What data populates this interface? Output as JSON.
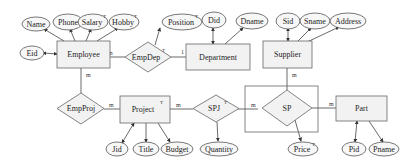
{
  "diagram": {
    "type": "entity-relationship",
    "entities": [
      {
        "id": "employee",
        "label": "Employee",
        "superscript": ""
      },
      {
        "id": "department",
        "label": "Department",
        "superscript": ""
      },
      {
        "id": "supplier",
        "label": "Supplier",
        "superscript": ""
      },
      {
        "id": "project",
        "label": "Project",
        "superscript": "T"
      },
      {
        "id": "part",
        "label": "Part",
        "superscript": ""
      }
    ],
    "relationships": [
      {
        "id": "empdep",
        "label": "EmpDep",
        "superscript": "T"
      },
      {
        "id": "empproj",
        "label": "EmpProj",
        "superscript": ""
      },
      {
        "id": "spj",
        "label": "SPJ",
        "superscript": "T"
      },
      {
        "id": "sp",
        "label": "SP",
        "superscript": "",
        "aggregated": true
      }
    ],
    "attributes": [
      {
        "id": "name",
        "label": "Name",
        "owner": "employee",
        "superscript": ""
      },
      {
        "id": "phone",
        "label": "Phone",
        "owner": "employee",
        "superscript": ""
      },
      {
        "id": "salary",
        "label": "Salary",
        "owner": "employee",
        "superscript": "T"
      },
      {
        "id": "hobby",
        "label": "Hobby",
        "owner": "employee",
        "superscript": "T"
      },
      {
        "id": "eid",
        "label": "Eid",
        "owner": "employee",
        "superscript": "",
        "key": true
      },
      {
        "id": "position",
        "label": "Position",
        "owner": "empdep",
        "superscript": "T"
      },
      {
        "id": "did",
        "label": "Did",
        "owner": "department",
        "superscript": "",
        "key": true
      },
      {
        "id": "dname",
        "label": "Dname",
        "owner": "department",
        "superscript": ""
      },
      {
        "id": "sid",
        "label": "Sid",
        "owner": "supplier",
        "superscript": "",
        "key": true
      },
      {
        "id": "sname",
        "label": "Sname",
        "owner": "supplier",
        "superscript": ""
      },
      {
        "id": "address",
        "label": "Address",
        "owner": "supplier",
        "superscript": ""
      },
      {
        "id": "jid",
        "label": "Jid",
        "owner": "project",
        "superscript": "",
        "key": true
      },
      {
        "id": "title",
        "label": "Title",
        "owner": "project",
        "superscript": ""
      },
      {
        "id": "budget",
        "label": "Budget",
        "owner": "project",
        "superscript": ""
      },
      {
        "id": "quantity",
        "label": "Quantity",
        "owner": "spj",
        "superscript": ""
      },
      {
        "id": "price",
        "label": "Price",
        "owner": "sp",
        "superscript": "T"
      },
      {
        "id": "pid",
        "label": "Pid",
        "owner": "part",
        "superscript": "",
        "key": true
      },
      {
        "id": "pname",
        "label": "Pname",
        "owner": "part",
        "superscript": ""
      }
    ],
    "cardinalities": {
      "employee_empdep": "m",
      "empdep_department": "1",
      "employee_empproj": "m",
      "empproj_project": "m",
      "project_spj": "m",
      "spj_sp": "m",
      "supplier_sp": "m",
      "sp_part": "m"
    }
  }
}
